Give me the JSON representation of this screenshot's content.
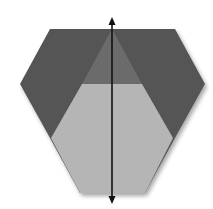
{
  "diagram": {
    "type": "origami-fold-step",
    "colors": {
      "background": "#ffffff",
      "outer_flaps": "#555555",
      "center_triangle": "#6b6b6b",
      "light_face": "#b5b5b5",
      "arrow": "#111111"
    },
    "shapes": {
      "hexagon": "50,29 175,29 205,84 175,138 145,193 80,193 50,138 20,84",
      "center_triangle": "112,29 82,84 142,84",
      "light_region": "82,84 142,84 173,138 145,193 80,193 51,138",
      "fold_arrow": {
        "x": 112,
        "y1": 18,
        "y2": 203
      }
    }
  }
}
